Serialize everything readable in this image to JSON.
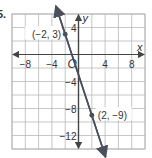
{
  "problem_number": "5.",
  "chart_data": {
    "type": "line",
    "title": "",
    "xlabel": "x",
    "ylabel": "y",
    "origin_label": "O",
    "xlim": [
      -10,
      10
    ],
    "ylim": [
      -14,
      6
    ],
    "grid": true,
    "grid_step": 2,
    "x_ticks": [
      -8,
      -4,
      4,
      8
    ],
    "x_tick_labels": [
      "−8",
      "−4",
      "4",
      "8"
    ],
    "y_ticks": [
      4,
      -4,
      -8,
      -12
    ],
    "y_tick_labels": [
      "4",
      "−4",
      "−8",
      "−12"
    ],
    "line": {
      "slope": -3,
      "intercept": -3,
      "arrows": "both"
    },
    "points": [
      {
        "x": -2,
        "y": 3,
        "label": "(−2, 3)",
        "label_side": "left"
      },
      {
        "x": 2,
        "y": -9,
        "label": "(2, −9)",
        "label_side": "right"
      }
    ],
    "colors": {
      "grid": "#b8b8b8",
      "axis": "#444444",
      "line": "#4a4f5c",
      "text": "#333333"
    }
  }
}
